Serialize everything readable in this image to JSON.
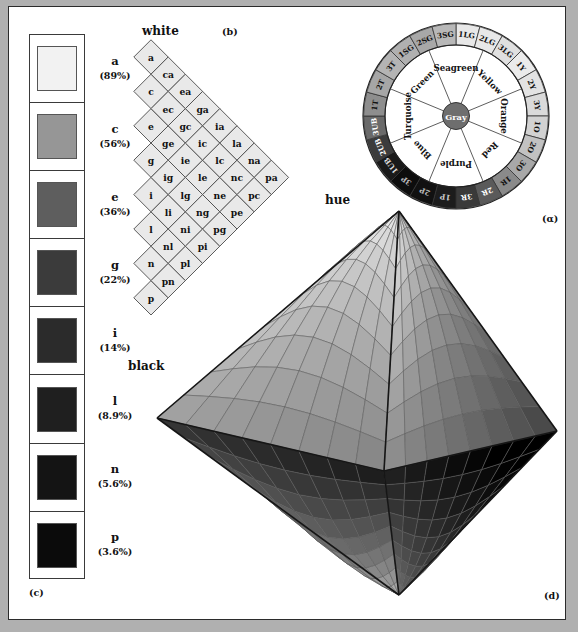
{
  "figure": {
    "panel_tags": {
      "a": "(α)",
      "b": "(b)",
      "c": "(c)",
      "d": "(d)"
    },
    "background_color": "#b0b0b0",
    "paper_color": "#ffffff"
  },
  "panel_c": {
    "tag": "(c)",
    "swatches": [
      {
        "label": "a",
        "percent": "(89%)",
        "color": "#f2f2f2"
      },
      {
        "label": "c",
        "percent": "(56%)",
        "color": "#969696"
      },
      {
        "label": "e",
        "percent": "(36%)",
        "color": "#5e5e5e"
      },
      {
        "label": "g",
        "percent": "(22%)",
        "color": "#3b3b3b"
      },
      {
        "label": "i",
        "percent": "(14%)",
        "color": "#2b2b2b"
      },
      {
        "label": "l",
        "percent": "(8.9%)",
        "color": "#1f1f1f"
      },
      {
        "label": "n",
        "percent": "(5.6%)",
        "color": "#141414"
      },
      {
        "label": "p",
        "percent": "(3.6%)",
        "color": "#0b0b0b"
      }
    ]
  },
  "panel_b": {
    "tag": "(b)",
    "top_label": "white",
    "bottom_label": "black",
    "right_label": "hue",
    "columns": [
      [
        "a",
        "c",
        "e",
        "g",
        "i",
        "l",
        "n",
        "p"
      ],
      [
        "ca",
        "ec",
        "ge",
        "ig",
        "li",
        "nl",
        "pn"
      ],
      [
        "ea",
        "gc",
        "ie",
        "lg",
        "ni",
        "pl"
      ],
      [
        "ga",
        "ic",
        "le",
        "ng",
        "pi"
      ],
      [
        "ia",
        "lc",
        "ne",
        "pg"
      ],
      [
        "la",
        "nc",
        "pe"
      ],
      [
        "na",
        "pc"
      ],
      [
        "pa"
      ]
    ]
  },
  "panel_a": {
    "tag": "(α)",
    "center_label": "Gray",
    "center_color": "#6e6e6e",
    "sectors": [
      {
        "name": "Seagreen",
        "angle": -90
      },
      {
        "name": "Yellow",
        "angle": -45
      },
      {
        "name": "Orange",
        "angle": 0
      },
      {
        "name": "Red",
        "angle": 45
      },
      {
        "name": "Purple",
        "angle": 90
      },
      {
        "name": "Blue",
        "angle": 135
      },
      {
        "name": "Turquoise",
        "angle": 180
      },
      {
        "name": "Green",
        "angle": -135
      }
    ],
    "ring_segments": [
      {
        "label": "1LG",
        "color": "#e8e8e8",
        "text": "#111111"
      },
      {
        "label": "2LG",
        "color": "#e8e8e8",
        "text": "#111111"
      },
      {
        "label": "3LG",
        "color": "#e0e0e0",
        "text": "#111111"
      },
      {
        "label": "1Y",
        "color": "#ebebeb",
        "text": "#111111"
      },
      {
        "label": "2Y",
        "color": "#e3e3e3",
        "text": "#111111"
      },
      {
        "label": "3Y",
        "color": "#dadada",
        "text": "#111111"
      },
      {
        "label": "1O",
        "color": "#d2d2d2",
        "text": "#111111"
      },
      {
        "label": "2O",
        "color": "#c2c2c2",
        "text": "#111111"
      },
      {
        "label": "3O",
        "color": "#a8a8a8",
        "text": "#111111"
      },
      {
        "label": "1R",
        "color": "#8a8a8a",
        "text": "#111111"
      },
      {
        "label": "2R",
        "color": "#5a5a5a",
        "text": "#ffffff"
      },
      {
        "label": "3R",
        "color": "#3a3a3a",
        "text": "#ffffff"
      },
      {
        "label": "1P",
        "color": "#1c1c1c",
        "text": "#cccccc"
      },
      {
        "label": "2P",
        "color": "#111111",
        "text": "#bbbbbb"
      },
      {
        "label": "3P",
        "color": "#0d0d0d",
        "text": "#bbbbbb"
      },
      {
        "label": "1UB",
        "color": "#1a1a1a",
        "text": "#dddddd"
      },
      {
        "label": "2UB",
        "color": "#3c3c3c",
        "text": "#ffffff"
      },
      {
        "label": "3UB",
        "color": "#6a6a6a",
        "text": "#ffffff"
      },
      {
        "label": "1T",
        "color": "#8e8e8e",
        "text": "#111111"
      },
      {
        "label": "2T",
        "color": "#a6a6a6",
        "text": "#111111"
      },
      {
        "label": "3T",
        "color": "#b4b4b4",
        "text": "#111111"
      },
      {
        "label": "1SG",
        "color": "#b0b0b0",
        "text": "#111111"
      },
      {
        "label": "2SG",
        "color": "#a8a8a8",
        "text": "#111111"
      },
      {
        "label": "3SG",
        "color": "#b8b8b8",
        "text": "#111111"
      }
    ]
  },
  "panel_d": {
    "tag": "(d)",
    "description": "color solid bipyramid"
  }
}
